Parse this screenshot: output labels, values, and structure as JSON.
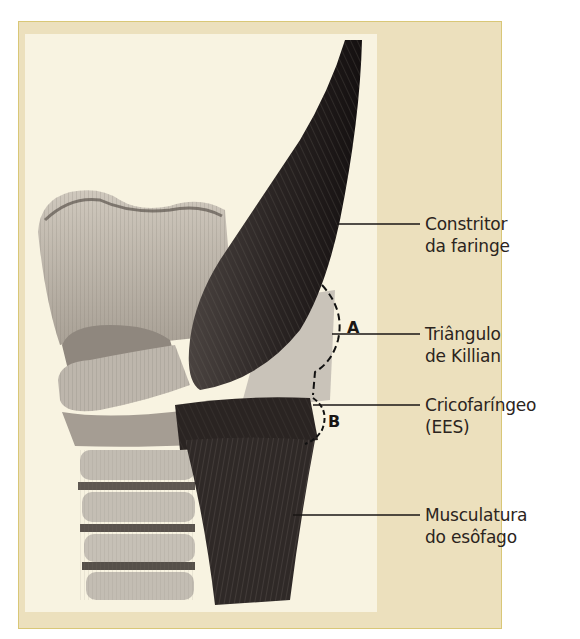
{
  "figure": {
    "colors": {
      "outer_panel": "#ece0bd",
      "outer_border": "#d9c777",
      "inner_panel": "#f8f3e1",
      "label_text": "#2b2420"
    },
    "labels": [
      {
        "id": "constritor",
        "line1": "Constritor",
        "line2": "da faringe"
      },
      {
        "id": "killian",
        "line1": "Triângulo",
        "line2": "de Killian"
      },
      {
        "id": "cricofaringeo",
        "line1": "Cricofaríngeo",
        "line2": "(EES)"
      },
      {
        "id": "esofago",
        "line1": "Musculatura",
        "line2": "do esôfago"
      }
    ],
    "region_markers": {
      "a": "A",
      "b": "B"
    }
  }
}
